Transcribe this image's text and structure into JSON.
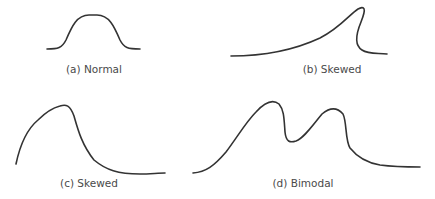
{
  "figure": {
    "panels": [
      {
        "id": "a",
        "label": "(a) Normal",
        "shape": "normal"
      },
      {
        "id": "b",
        "label": "(b) Skewed",
        "shape": "skewed-left-tail-steep-right"
      },
      {
        "id": "c",
        "label": "(c) Skewed",
        "shape": "skewed-right-tail"
      },
      {
        "id": "d",
        "label": "(d) Bimodal",
        "shape": "bimodal"
      }
    ],
    "stroke_color": "#333333",
    "label_color": "#4a4a4a"
  }
}
